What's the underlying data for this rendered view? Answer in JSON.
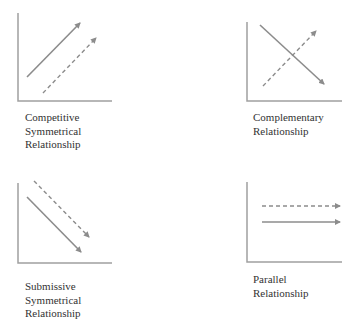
{
  "panels": [
    {
      "id": "competitive",
      "label_lines": [
        "Competitive",
        "Symmetrical",
        "Relationship"
      ]
    },
    {
      "id": "complementary",
      "label_lines": [
        "Complementary",
        "Relationship"
      ]
    },
    {
      "id": "submissive",
      "label_lines": [
        "Submissive",
        "Symmetrical",
        "Relationship"
      ]
    },
    {
      "id": "parallel",
      "label_lines": [
        "Parallel",
        "Relationship"
      ]
    }
  ],
  "colors": {
    "axis": "#9a9a9a",
    "arrow": "#8c8c8c",
    "text": "#333333"
  }
}
